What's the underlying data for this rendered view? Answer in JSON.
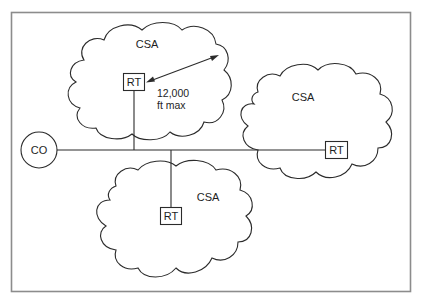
{
  "diagram": {
    "type": "network-topology",
    "central_office": {
      "label": "CO"
    },
    "serving_areas": [
      {
        "id": "top",
        "label": "CSA",
        "remote_terminal": "RT"
      },
      {
        "id": "right",
        "label": "CSA",
        "remote_terminal": "RT"
      },
      {
        "id": "bottom",
        "label": "CSA",
        "remote_terminal": "RT"
      }
    ],
    "distance_annotation": {
      "line1": "12,000",
      "line2": "ft max"
    },
    "colors": {
      "frame": "#8c8c8c",
      "stroke": "#2b2b2b",
      "background": "#ffffff"
    }
  }
}
